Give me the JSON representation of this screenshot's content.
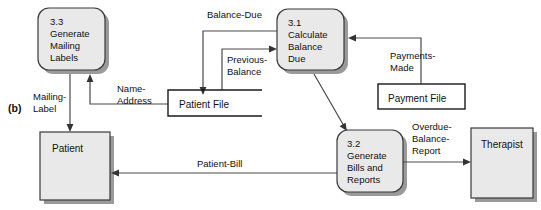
{
  "figure": {
    "part_label": "(b)",
    "accent_fill": "#e9e9e9",
    "stroke_color": "#3a3a3a",
    "flow_color": "#4a4a4a",
    "background": "#ffffff"
  },
  "processes": [
    {
      "id": "3.3",
      "number": "3.3",
      "name_lines": [
        "Generate",
        "Mailing",
        "Labels"
      ],
      "line1": "Generate",
      "line2": "Mailing",
      "line3": "Labels"
    },
    {
      "id": "3.1",
      "number": "3.1",
      "name_lines": [
        "Calculate",
        "Balance",
        "Due"
      ],
      "line1": "Calculate",
      "line2": "Balance",
      "line3": "Due"
    },
    {
      "id": "3.2",
      "number": "3.2",
      "name_lines": [
        "Generate",
        "Bills and",
        "Reports"
      ],
      "line1": "Generate",
      "line2": "Bills and",
      "line3": "Reports"
    }
  ],
  "entities": [
    {
      "id": "patient",
      "label": "Patient"
    },
    {
      "id": "therapist",
      "label": "Therapist"
    }
  ],
  "datastores": [
    {
      "id": "patient-file",
      "label": "Patient File"
    },
    {
      "id": "payment-file",
      "label": "Payment File"
    }
  ],
  "flows": [
    {
      "id": "balance-due",
      "label": "Balance-Due",
      "from": "3.1",
      "to": "patient-file"
    },
    {
      "id": "previous-balance",
      "label_line1": "Previous-",
      "label_line2": "Balance",
      "label": "Previous-Balance",
      "from": "patient-file",
      "to": "3.1"
    },
    {
      "id": "payments-made",
      "label_line1": "Payments-",
      "label_line2": "Made",
      "label": "Payments-Made",
      "from": "payment-file",
      "to": "3.1"
    },
    {
      "id": "name-address",
      "label_line1": "Name-",
      "label_line2": "Address",
      "label": "Name-Address",
      "from": "patient-file",
      "to": "3.3"
    },
    {
      "id": "mailing-label",
      "label_line1": "Mailing-",
      "label_line2": "Label",
      "label": "Mailing-Label",
      "from": "3.3",
      "to": "patient"
    },
    {
      "id": "patient-bill",
      "label": "Patient-Bill",
      "from": "3.2",
      "to": "patient"
    },
    {
      "id": "overdue-balance-report",
      "label_line1": "Overdue-",
      "label_line2": "Balance-",
      "label_line3": "Report",
      "label": "Overdue-Balance-Report",
      "from": "3.2",
      "to": "therapist"
    }
  ]
}
